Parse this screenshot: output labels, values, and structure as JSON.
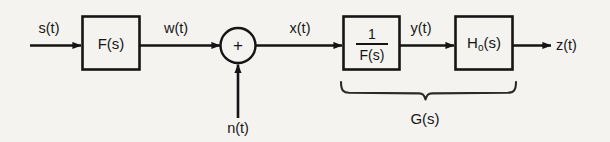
{
  "diagram": {
    "background_color": "#f4f3f0",
    "line_color": "#151515",
    "signals": {
      "input": "s(t)",
      "filtered": "w(t)",
      "noise": "n(t)",
      "summed": "x(t)",
      "inverse_out": "y(t)",
      "output": "z(t)"
    },
    "blocks": {
      "filter": "F(s)",
      "inverse_numerator": "1",
      "inverse_denominator": "F(s)",
      "optimum_filter_main": "H",
      "optimum_filter_sub": "o",
      "optimum_filter_arg": "(s)",
      "summing_junction_sign": "+"
    },
    "brace": {
      "label": "G(s)"
    }
  }
}
